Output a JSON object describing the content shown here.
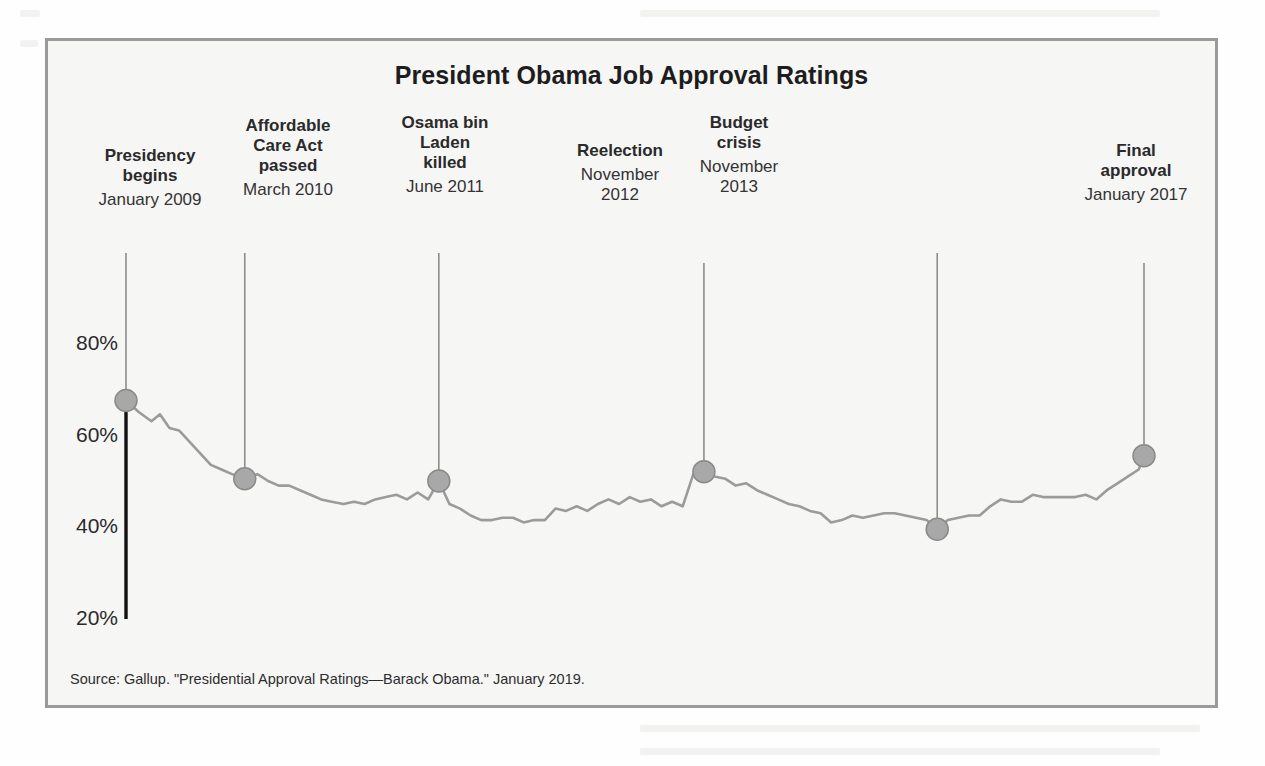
{
  "figure": {
    "title": "President Obama Job Approval Ratings",
    "source": "Source: Gallup. \"Presidential Approval Ratings—Barack Obama.\" January 2019.",
    "frame_color": "#9a9a9a",
    "background_color": "#f6f6f5"
  },
  "chart_data": {
    "type": "line",
    "title": "President Obama Job Approval Ratings",
    "xlabel": "",
    "ylabel": "",
    "ylim": [
      15,
      85
    ],
    "yticks": [
      20,
      40,
      60,
      80
    ],
    "ytick_labels": [
      "20%",
      "40%",
      "60%",
      "80%"
    ],
    "grid": false,
    "legend": "none",
    "line_color": "#9b9b9b",
    "marker_color": "#a8a8a8",
    "marker_edge_color": "#8a8a8a",
    "axis_color": "#111111",
    "series": [
      {
        "name": "Job approval",
        "x": [
          0,
          1.2,
          2.4,
          3.2,
          4.1,
          5.0,
          6.0,
          7.0,
          8.0,
          9.0,
          10.0,
          11.2,
          12.4,
          13.4,
          14.4,
          15.4,
          16.4,
          17.4,
          18.4,
          19.4,
          20.5,
          21.5,
          22.5,
          23.5,
          24.5,
          25.5,
          26.5,
          27.5,
          28.5,
          29.5,
          30.5,
          31.5,
          32.5,
          33.5,
          34.5,
          35.5,
          36.5,
          37.5,
          38.5,
          39.5,
          40.5,
          41.5,
          42.5,
          43.5,
          44.5,
          45.5,
          46.5,
          47.5,
          48.5,
          49.5,
          50.5,
          51.5,
          52.5,
          53.5,
          54.5,
          55.5,
          56.5,
          57.5,
          58.5,
          59.5,
          60.5,
          61.5,
          62.5,
          63.5,
          64.5,
          65.5,
          66.5,
          67.5,
          68.5,
          69.5,
          70.5,
          71.5,
          72.5,
          73.5,
          74.5,
          75.5,
          76.5,
          77.5,
          78.5,
          79.5,
          80.5,
          81.5,
          82.5,
          83.5,
          84.5,
          85.5,
          86.5,
          87.5,
          88.5,
          89.5,
          90.5,
          91.5,
          92.5,
          93.5,
          94.5,
          95.5,
          96.0
        ],
        "values": [
          67.5,
          65.0,
          63.0,
          64.5,
          61.5,
          61.0,
          58.5,
          56.0,
          53.5,
          52.5,
          51.5,
          50.5,
          51.5,
          50.0,
          49.0,
          49.0,
          48.0,
          47.0,
          46.0,
          45.5,
          45.0,
          45.5,
          45.0,
          46.0,
          46.5,
          47.0,
          46.0,
          47.5,
          46.0,
          50.0,
          45.0,
          44.0,
          42.5,
          41.5,
          41.5,
          42.0,
          42.0,
          41.0,
          41.5,
          41.5,
          44.0,
          43.5,
          44.5,
          43.5,
          45.0,
          46.0,
          45.0,
          46.5,
          45.5,
          46.0,
          44.5,
          45.5,
          44.5,
          51.5,
          52.0,
          51.0,
          50.5,
          49.0,
          49.5,
          48.0,
          47.0,
          46.0,
          45.0,
          44.5,
          43.5,
          43.0,
          41.0,
          41.5,
          42.5,
          42.0,
          42.5,
          43.0,
          43.0,
          42.5,
          42.0,
          41.5,
          39.5,
          41.5,
          42.0,
          42.5,
          42.5,
          44.5,
          46.0,
          45.5,
          45.5,
          47.0,
          46.5,
          46.5,
          46.5,
          46.5,
          47.0,
          46.0,
          48.0,
          49.5,
          51.0,
          52.5,
          55.5
        ]
      }
    ],
    "annotated_points": [
      {
        "label": "Presidency begins",
        "date": "January 2009",
        "x": 0,
        "value": 67.5
      },
      {
        "label": "Affordable Care Act passed",
        "date": "March 2010",
        "x": 11.2,
        "value": 50.5
      },
      {
        "label": "Osama bin Laden killed",
        "date": "June 2011",
        "x": 29.5,
        "value": 50.0
      },
      {
        "label": "Reelection",
        "date": "November 2012",
        "x": 54.5,
        "value": 52.0
      },
      {
        "label": "Budget crisis",
        "date": "November 2013",
        "x": 76.5,
        "value": 39.5
      },
      {
        "label": "Final approval",
        "date": "January 2017",
        "x": 96.0,
        "value": 55.5
      }
    ]
  },
  "annotations": [
    {
      "title": "Presidency\nbegins",
      "date": "January 2009"
    },
    {
      "title": "Affordable\nCare Act\npassed",
      "date": "March 2010"
    },
    {
      "title": "Osama bin\nLaden\nkilled",
      "date": "June 2011"
    },
    {
      "title": "Reelection",
      "date": "November\n2012"
    },
    {
      "title": "Budget\ncrisis",
      "date": "November\n2013"
    },
    {
      "title": "Final\napproval",
      "date": "January 2017"
    }
  ],
  "yticks": [
    "80%",
    "60%",
    "40%",
    "20%"
  ]
}
